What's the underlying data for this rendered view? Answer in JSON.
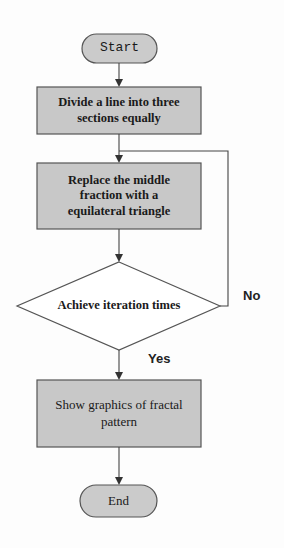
{
  "diagram": {
    "type": "flowchart",
    "nodes": {
      "start": {
        "label": "Start",
        "shape": "terminator"
      },
      "divide": {
        "label": "Divide a line into three sections equally",
        "shape": "process"
      },
      "replace": {
        "label": "Replace the middle fraction  with a equilateral triangle",
        "shape": "process"
      },
      "decision": {
        "label": "Achieve iteration times",
        "shape": "decision"
      },
      "show": {
        "label": "Show graphics of fractal pattern",
        "shape": "process"
      },
      "end": {
        "label": "End",
        "shape": "terminator"
      }
    },
    "edges": [
      {
        "from": "start",
        "to": "divide",
        "label": ""
      },
      {
        "from": "divide",
        "to": "replace",
        "label": ""
      },
      {
        "from": "replace",
        "to": "decision",
        "label": ""
      },
      {
        "from": "decision",
        "to": "replace",
        "label": "No"
      },
      {
        "from": "decision",
        "to": "show",
        "label": "Yes"
      },
      {
        "from": "show",
        "to": "end",
        "label": ""
      }
    ],
    "labels": {
      "no": "No",
      "yes": "Yes"
    },
    "colors": {
      "box_fill": "#c8c8c8",
      "stroke": "#555555",
      "background": "#fdfdfd"
    }
  }
}
